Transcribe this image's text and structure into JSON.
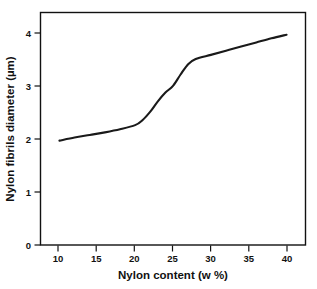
{
  "chart_data": {
    "type": "line",
    "title": "",
    "xlabel": "Nylon content (w %)",
    "ylabel": "Nylon fibrils diameter (µm)",
    "xlim": [
      7.5,
      42.5
    ],
    "ylim": [
      0,
      4.5
    ],
    "xticks": [
      10,
      15,
      20,
      25,
      30,
      35,
      40
    ],
    "xticklabels": [
      "10",
      "15",
      "20",
      "25",
      "30",
      "35",
      "40"
    ],
    "yticks": [
      0,
      1,
      2,
      3,
      4
    ],
    "yticklabels": [
      "0",
      "1",
      "2",
      "3",
      "4"
    ],
    "grid": false,
    "legend": false,
    "legend_position": "none",
    "series": [
      {
        "name": "Nylon fibrils diameter",
        "color": "#1a1a1a",
        "x": [
          10,
          12,
          14,
          16,
          18,
          20,
          21,
          22,
          23,
          24,
          25,
          26,
          27,
          28,
          30,
          32,
          34,
          36,
          38,
          40
        ],
        "values": [
          2.02,
          2.08,
          2.13,
          2.18,
          2.24,
          2.32,
          2.42,
          2.58,
          2.78,
          2.95,
          3.08,
          3.3,
          3.5,
          3.6,
          3.68,
          3.76,
          3.84,
          3.92,
          4.0,
          4.07
        ]
      }
    ]
  },
  "figure": {
    "x_axis_title": "Nylon content (w %)",
    "y_axis_title": "Nylon fibrils diameter (µm)",
    "caption_fragment": ""
  },
  "colors": {
    "curve": "#1a1a1a",
    "axis": "#111111",
    "background": "#ffffff"
  }
}
